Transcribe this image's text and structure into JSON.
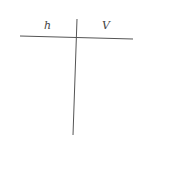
{
  "t_chart": {
    "columns": [
      {
        "header": "h",
        "values": []
      },
      {
        "header": "V",
        "values": []
      }
    ],
    "line_color": "#555555"
  }
}
